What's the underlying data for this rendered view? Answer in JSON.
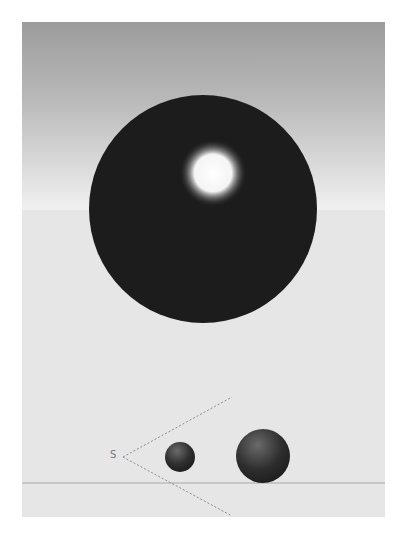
{
  "figure": {
    "type": "rendered-3d-scene",
    "colors": {
      "sky_top": "#9c9c9c",
      "sky_bottom": "#f0f0f0",
      "floor": "#e6e6e6",
      "sphere": "#1a1a1a",
      "highlight": "#ffffff",
      "dotted_line": "#8a8a8a",
      "ground_line": "#a8a8a8"
    },
    "large_sphere": {
      "cx": 203,
      "cy": 209,
      "r": 113,
      "highlight_cx": 213,
      "highlight_cy": 173,
      "highlight_r": 30
    },
    "bottom_inset": {
      "source_label": "S",
      "source": {
        "x": 123,
        "y": 457
      },
      "ray_upper_end": {
        "x": 232,
        "y": 397
      },
      "ray_lower_end": {
        "x": 232,
        "y": 515
      },
      "ground_line_y": 483,
      "small_sphere": {
        "cx": 180,
        "cy": 457,
        "r": 15
      },
      "big_sphere": {
        "cx": 263,
        "cy": 456,
        "r": 27
      }
    }
  }
}
